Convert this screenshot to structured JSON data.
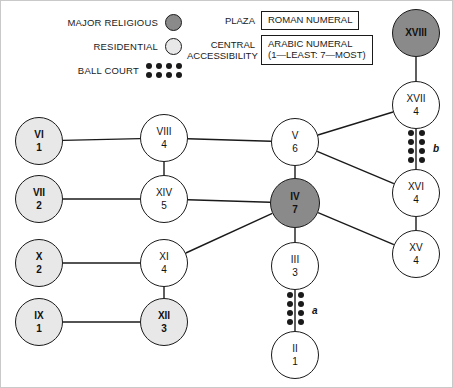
{
  "legend": {
    "symbols": [
      {
        "label": "MAJOR RELIGIOUS",
        "swatch": "dark-gray-circle",
        "color": "#8a8a8a"
      },
      {
        "label": "RESIDENTIAL",
        "swatch": "light-gray-circle",
        "color": "#e8e8e8"
      },
      {
        "label": "BALL COURT",
        "swatch": "dot-grid",
        "color": "#1a1a1a"
      }
    ],
    "keys": [
      {
        "name": "PLAZA",
        "name_line2": "",
        "value": "ROMAN NUMERAL",
        "value_line2": ""
      },
      {
        "name": "CENTRAL",
        "name_line2": "ACCESSIBILITY",
        "value": "ARABIC NUMERAL",
        "value_line2": "(1—LEAST: 7—MOST)"
      }
    ]
  },
  "chart_data": {
    "type": "diagram",
    "nodes": [
      {
        "id": "XVIII",
        "roman": "XVIII",
        "arabic": "",
        "type": "major",
        "x": 415,
        "y": 32,
        "r": 24
      },
      {
        "id": "XVII",
        "roman": "XVII",
        "arabic": "4",
        "type": "plain",
        "x": 415,
        "y": 104,
        "r": 24
      },
      {
        "id": "XVI",
        "roman": "XVI",
        "arabic": "4",
        "type": "plain",
        "x": 415,
        "y": 192,
        "r": 24
      },
      {
        "id": "XV",
        "roman": "XV",
        "arabic": "4",
        "type": "plain",
        "x": 415,
        "y": 253,
        "r": 24
      },
      {
        "id": "V",
        "roman": "V",
        "arabic": "6",
        "type": "plain",
        "x": 294,
        "y": 141,
        "r": 24
      },
      {
        "id": "IV",
        "roman": "IV",
        "arabic": "7",
        "type": "major",
        "x": 294,
        "y": 202,
        "r": 25
      },
      {
        "id": "III",
        "roman": "III",
        "arabic": "3",
        "type": "plain",
        "x": 294,
        "y": 265,
        "r": 24
      },
      {
        "id": "II",
        "roman": "II",
        "arabic": "1",
        "type": "plain",
        "x": 294,
        "y": 354,
        "r": 24
      },
      {
        "id": "VIII",
        "roman": "VIII",
        "arabic": "4",
        "type": "plain",
        "x": 163,
        "y": 137,
        "r": 24
      },
      {
        "id": "XIV",
        "roman": "XIV",
        "arabic": "5",
        "type": "plain",
        "x": 163,
        "y": 198,
        "r": 24
      },
      {
        "id": "XI",
        "roman": "XI",
        "arabic": "4",
        "type": "plain",
        "x": 163,
        "y": 262,
        "r": 24
      },
      {
        "id": "XII",
        "roman": "XII",
        "arabic": "3",
        "type": "residential",
        "x": 163,
        "y": 321,
        "r": 24
      },
      {
        "id": "VI",
        "roman": "VI",
        "arabic": "1",
        "type": "residential",
        "x": 38,
        "y": 140,
        "r": 24
      },
      {
        "id": "VII",
        "roman": "VII",
        "arabic": "2",
        "type": "residential",
        "x": 38,
        "y": 198,
        "r": 24
      },
      {
        "id": "X",
        "roman": "X",
        "arabic": "2",
        "type": "residential",
        "x": 38,
        "y": 262,
        "r": 24
      },
      {
        "id": "IX",
        "roman": "IX",
        "arabic": "1",
        "type": "residential",
        "x": 38,
        "y": 321,
        "r": 24
      }
    ],
    "edges": [
      {
        "from": "XVIII",
        "to": "XVII"
      },
      {
        "from": "XVII",
        "to": "XVI",
        "ballcourt": "b"
      },
      {
        "from": "XVI",
        "to": "XV"
      },
      {
        "from": "V",
        "to": "XVII"
      },
      {
        "from": "V",
        "to": "XVI"
      },
      {
        "from": "V",
        "to": "IV"
      },
      {
        "from": "V",
        "to": "VIII"
      },
      {
        "from": "IV",
        "to": "XV"
      },
      {
        "from": "IV",
        "to": "XIV"
      },
      {
        "from": "IV",
        "to": "XI"
      },
      {
        "from": "IV",
        "to": "III"
      },
      {
        "from": "III",
        "to": "II",
        "ballcourt": "a"
      },
      {
        "from": "VIII",
        "to": "XIV"
      },
      {
        "from": "VIII",
        "to": "VI"
      },
      {
        "from": "XIV",
        "to": "VII"
      },
      {
        "from": "XI",
        "to": "XII"
      },
      {
        "from": "XI",
        "to": "X"
      },
      {
        "from": "XII",
        "to": "IX"
      }
    ],
    "ballcourts": [
      {
        "label": "a",
        "x": 294,
        "y": 310,
        "tag_x": 311,
        "tag_y": 304
      },
      {
        "label": "b",
        "x": 415,
        "y": 148,
        "tag_x": 432,
        "tag_y": 142
      }
    ]
  }
}
